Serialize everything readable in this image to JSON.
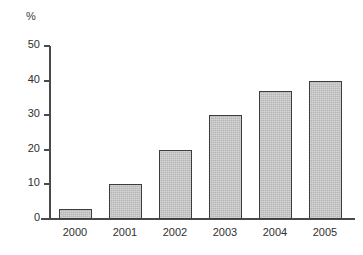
{
  "chart_data": {
    "type": "bar",
    "title": "",
    "subtitle": "",
    "xlabel": "",
    "ylabel": "%",
    "unit_label": "%",
    "categories": [
      "2000",
      "2001",
      "2002",
      "2003",
      "2004",
      "2005"
    ],
    "values": [
      3,
      10,
      20,
      30,
      37,
      40
    ],
    "series": [
      {
        "name": "",
        "values": [
          3,
          10,
          20,
          30,
          37,
          40
        ]
      }
    ],
    "ylim": [
      0,
      50
    ],
    "ytick_labels": [
      "0",
      "10",
      "20",
      "30",
      "40",
      "50"
    ],
    "ytick_values": [
      0,
      10,
      20,
      30,
      40,
      50
    ],
    "grid": false,
    "legend": false,
    "legend_position": "none",
    "annotations": [],
    "colors": {
      "bar_fill": "#b6b6b6",
      "bar_border": "#3d3d3d",
      "axis": "#4a4a4a",
      "text": "#2f2f2f",
      "background": "#ffffff"
    }
  }
}
